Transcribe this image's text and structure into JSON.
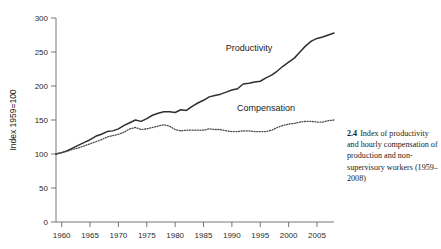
{
  "caption": {
    "number": "2.4",
    "text": "Index of productivity and hourly compensation of production and non-supervisory workers (1959–2008)"
  },
  "chart_data": {
    "type": "line",
    "title": "",
    "xlabel": "",
    "ylabel": "Index 1959=100",
    "xlim": [
      1959,
      2008
    ],
    "ylim": [
      0,
      300
    ],
    "yticks": [
      0,
      50,
      100,
      150,
      200,
      250,
      300
    ],
    "xticks": [
      1960,
      1965,
      1970,
      1975,
      1980,
      1985,
      1990,
      1995,
      2000,
      2005
    ],
    "grid": false,
    "legend_position": "inline-annotation",
    "annotations": [
      {
        "label": "Productivity",
        "x": 1993,
        "y": 252
      },
      {
        "label": "Compensation",
        "x": 1996,
        "y": 163
      }
    ],
    "x": [
      1959,
      1960,
      1961,
      1962,
      1963,
      1964,
      1965,
      1966,
      1967,
      1968,
      1969,
      1970,
      1971,
      1972,
      1973,
      1974,
      1975,
      1976,
      1977,
      1978,
      1979,
      1980,
      1981,
      1982,
      1983,
      1984,
      1985,
      1986,
      1987,
      1988,
      1989,
      1990,
      1991,
      1992,
      1993,
      1994,
      1995,
      1996,
      1997,
      1998,
      1999,
      2000,
      2001,
      2002,
      2003,
      2004,
      2005,
      2006,
      2007,
      2008
    ],
    "series": [
      {
        "name": "Productivity",
        "style": "solid",
        "color": "#2f2f2f",
        "values": [
          100,
          102,
          105,
          109,
          113,
          117,
          121,
          126,
          129,
          133,
          134,
          137,
          142,
          146,
          150,
          148,
          152,
          157,
          160,
          162,
          162,
          161,
          165,
          164,
          170,
          175,
          179,
          184,
          186,
          188,
          191,
          194,
          196,
          203,
          204,
          206,
          207,
          212,
          216,
          222,
          229,
          235,
          241,
          250,
          259,
          266,
          270,
          272,
          275,
          278
        ]
      },
      {
        "name": "Compensation",
        "style": "dotted",
        "color": "#4a4a4a",
        "values": [
          100,
          102,
          104,
          107,
          109,
          112,
          115,
          118,
          121,
          125,
          127,
          129,
          132,
          137,
          139,
          136,
          137,
          139,
          141,
          143,
          141,
          136,
          134,
          135,
          135,
          135,
          135,
          137,
          136,
          136,
          134,
          133,
          133,
          134,
          134,
          133,
          133,
          133,
          135,
          139,
          142,
          144,
          145,
          147,
          148,
          148,
          147,
          147,
          149,
          150
        ]
      }
    ]
  }
}
